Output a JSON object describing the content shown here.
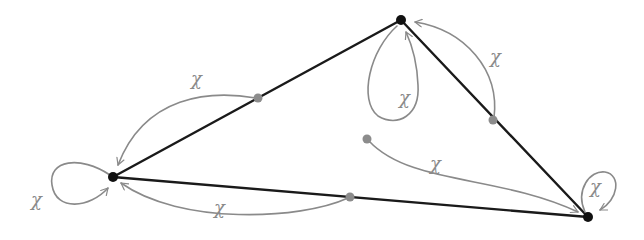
{
  "diagram": {
    "title": "",
    "colors": {
      "edge": "#1a1a1a",
      "arrow": "#8a8a8a",
      "vertex": "#111111",
      "midpoint": "#8c8c8c",
      "label": "#8a8a8a",
      "background": "#ffffff"
    },
    "vertices": [
      {
        "id": "top",
        "x": 401,
        "y": 20
      },
      {
        "id": "left",
        "x": 113,
        "y": 177
      },
      {
        "id": "bottom-right",
        "x": 588,
        "y": 217
      }
    ],
    "edges": [
      {
        "from": "left",
        "to": "top"
      },
      {
        "from": "top",
        "to": "bottom-right"
      },
      {
        "from": "left",
        "to": "bottom-right"
      }
    ],
    "midpoints": [
      {
        "id": "mid-left-top",
        "x": 258,
        "y": 98
      },
      {
        "id": "mid-top-right",
        "x": 493,
        "y": 120
      },
      {
        "id": "mid-bottom",
        "x": 350,
        "y": 197
      },
      {
        "id": "interior",
        "x": 367,
        "y": 139
      }
    ],
    "arrows": [
      {
        "id": "arrow-midlefttop-to-left",
        "label": "χ"
      },
      {
        "id": "loop-left",
        "label": "χ"
      },
      {
        "id": "arrow-midbottom-to-left",
        "label": "χ"
      },
      {
        "id": "loop-top",
        "label": "χ"
      },
      {
        "id": "arrow-midtopright-to-top",
        "label": "χ"
      },
      {
        "id": "arrow-interior-to-bottomright",
        "label": "χ"
      },
      {
        "id": "loop-bottom-right",
        "label": "χ"
      }
    ]
  }
}
